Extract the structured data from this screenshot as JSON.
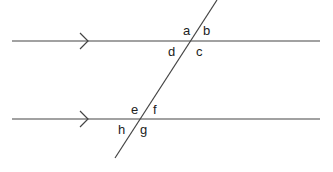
{
  "diagram": {
    "type": "parallel-lines-transversal",
    "stroke_color": "#444444",
    "parallel_lines": [
      {
        "id": "top",
        "x1": 12,
        "y1": 41,
        "x2": 320,
        "y2": 41,
        "arrow_x": 88
      },
      {
        "id": "bottom",
        "x1": 12,
        "y1": 119,
        "x2": 320,
        "y2": 119,
        "arrow_x": 88
      }
    ],
    "transversal": {
      "x1": 217,
      "y1": 0,
      "x2": 115,
      "y2": 158
    },
    "angle_labels": [
      {
        "text": "a",
        "x": 183,
        "y": 35
      },
      {
        "text": "b",
        "x": 203,
        "y": 35
      },
      {
        "text": "d",
        "x": 168,
        "y": 56
      },
      {
        "text": "c",
        "x": 196,
        "y": 56
      },
      {
        "text": "e",
        "x": 131,
        "y": 114
      },
      {
        "text": "f",
        "x": 153,
        "y": 114
      },
      {
        "text": "h",
        "x": 118,
        "y": 134
      },
      {
        "text": "g",
        "x": 140,
        "y": 134
      }
    ]
  }
}
